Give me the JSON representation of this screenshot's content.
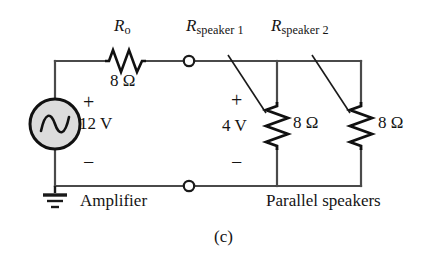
{
  "figure": {
    "caption": "(c)",
    "blocks": {
      "amplifier_label": "Amplifier",
      "speakers_label": "Parallel speakers"
    },
    "components": {
      "series_resistor": {
        "name_main": "R",
        "name_sub": "o",
        "value": "8 Ω",
        "icon": "resistor-zigzag-icon"
      },
      "speaker1_resistor": {
        "name_main": "R",
        "name_sub": "speaker 1",
        "value": "8 Ω",
        "icon": "resistor-zigzag-icon"
      },
      "speaker2_resistor": {
        "name_main": "R",
        "name_sub": "speaker 2",
        "value": "8 Ω",
        "icon": "resistor-zigzag-icon"
      },
      "source": {
        "value": "12 V",
        "plus": "+",
        "minus": "−",
        "icon": "ac-voltage-source-icon"
      },
      "speaker_voltage": {
        "value": "4 V",
        "plus": "+",
        "minus": "−"
      },
      "ground": {
        "icon": "ground-icon"
      },
      "terminals": {
        "icon": "open-terminal-node-icon",
        "count": "2"
      }
    },
    "colors": {
      "wire": "#4a4a4a",
      "ink": "#141414",
      "source_fill": "#dcdcdc",
      "background": "#ffffff"
    }
  }
}
